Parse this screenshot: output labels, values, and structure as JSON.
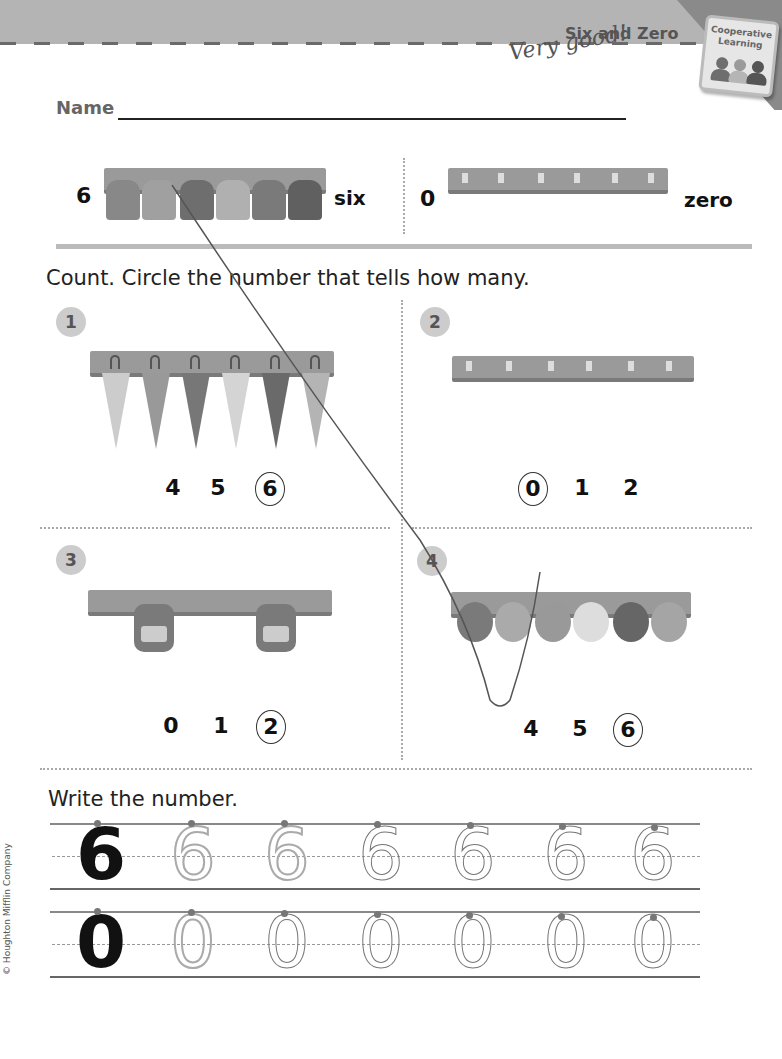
{
  "header": {
    "title": "Six and Zero",
    "badge": {
      "line1": "Cooperative",
      "line2": "Learning",
      "people_colors": [
        "#6e6e6e",
        "#b5b5b5",
        "#555555"
      ]
    },
    "teacher_comment": "Very good!"
  },
  "name_field": {
    "label": "Name",
    "value": ""
  },
  "intro": {
    "left": {
      "number": "6",
      "word": "six",
      "object": "coats",
      "count": 6
    },
    "right": {
      "number": "0",
      "word": "zero",
      "object": "empty hook rack",
      "count": 0
    }
  },
  "section1": {
    "instruction": "Count. Circle the number that tells how many.",
    "items": [
      {
        "id": "1",
        "object": "umbrellas",
        "count": 6,
        "choices": [
          "4",
          "5",
          "6"
        ],
        "circled": "6"
      },
      {
        "id": "2",
        "object": "empty rack",
        "count": 0,
        "choices": [
          "0",
          "1",
          "2"
        ],
        "circled": "0"
      },
      {
        "id": "3",
        "object": "backpacks",
        "count": 2,
        "choices": [
          "0",
          "1",
          "2"
        ],
        "circled": "2"
      },
      {
        "id": "4",
        "object": "caps",
        "count": 6,
        "choices": [
          "4",
          "5",
          "6"
        ],
        "circled": "6"
      }
    ]
  },
  "section2": {
    "instruction": "Write the number.",
    "rows": [
      {
        "digit": "6",
        "model": "6",
        "traced": [
          "6",
          "6"
        ],
        "handwritten": [
          "6",
          "6",
          "6",
          "6"
        ]
      },
      {
        "digit": "0",
        "model": "0",
        "traced": [
          "0"
        ],
        "handwritten": [
          "0",
          "0",
          "0",
          "0",
          "0"
        ]
      }
    ]
  },
  "footer": {
    "copyright": "© Houghton Mifflin Company"
  }
}
